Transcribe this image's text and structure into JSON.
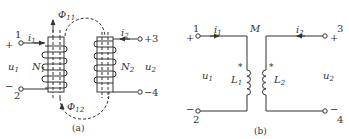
{
  "figure_a": {
    "caption": "(a)",
    "terminal_1": {
      "number": "1",
      "polarity": "+"
    },
    "terminal_2": {
      "number": "2",
      "polarity": "−"
    },
    "terminal_3": {
      "number": "3",
      "polarity": "+"
    },
    "terminal_4": {
      "number": "4",
      "polarity": "−"
    },
    "current_1": {
      "symbol": "i",
      "sub": "1"
    },
    "current_2": {
      "symbol": "i",
      "sub": "2"
    },
    "voltage_1": {
      "symbol": "u",
      "sub": "1"
    },
    "voltage_2": {
      "symbol": "u",
      "sub": "2"
    },
    "turns_1": {
      "symbol": "N",
      "sub": "1"
    },
    "turns_2": {
      "symbol": "N",
      "sub": "2"
    },
    "flux_11": {
      "symbol": "Φ",
      "sub": "11"
    },
    "flux_12": {
      "symbol": "Φ",
      "sub": "12"
    }
  },
  "figure_b": {
    "caption": "(b)",
    "terminal_1": {
      "number": "1",
      "polarity": "+"
    },
    "terminal_2": {
      "number": "2",
      "polarity": "−"
    },
    "terminal_3": {
      "number": "3",
      "polarity": "+"
    },
    "terminal_4": {
      "number": "4",
      "polarity": "−"
    },
    "current_1": {
      "symbol": "i",
      "sub": "1"
    },
    "current_2": {
      "symbol": "i",
      "sub": "2"
    },
    "voltage_1": {
      "symbol": "u",
      "sub": "1"
    },
    "voltage_2": {
      "symbol": "u",
      "sub": "2"
    },
    "inductor_1": {
      "symbol": "L",
      "sub": "1"
    },
    "inductor_2": {
      "symbol": "L",
      "sub": "2"
    },
    "mutual": "M",
    "dot_mark": "*"
  },
  "colors": {
    "ink": "#333333",
    "background": "#ffffff"
  }
}
